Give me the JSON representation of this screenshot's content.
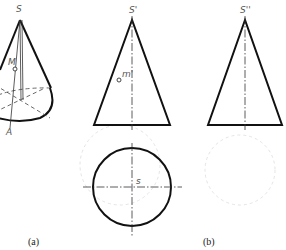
{
  "figure": {
    "panel_a": {
      "caption": "(a)",
      "isometric": {
        "apex_label": "S",
        "point_label": "M",
        "base_point_label": "A"
      },
      "front_view": {
        "apex_label": "S'",
        "point_label": "m'"
      },
      "top_view": {
        "center_label": "s"
      }
    },
    "panel_b": {
      "caption": "(b)",
      "side_view": {
        "apex_label": "S''"
      }
    }
  },
  "colors": {
    "outline": "#111111",
    "construction": "#444444",
    "label": "#555555",
    "background": "#ffffff"
  }
}
